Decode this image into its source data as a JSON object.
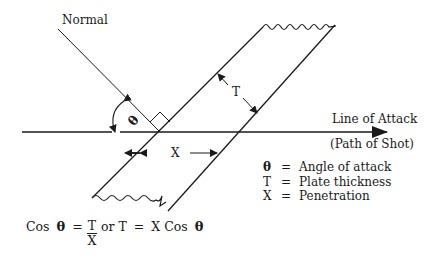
{
  "labels": {
    "normal": "Normal",
    "line_of_attack": "Line of Attack",
    "path_of_shot": "(Path of Shot)",
    "thickness_symbol": "T",
    "penetration_symbol": "X",
    "angle_symbol": "θ"
  },
  "legend": [
    {
      "symbol": "θ",
      "equals": "=",
      "meaning": "Angle of attack"
    },
    {
      "symbol": "T",
      "equals": "=",
      "meaning": "Plate thickness"
    },
    {
      "symbol": "X",
      "equals": "=",
      "meaning": "Penetration"
    }
  ],
  "formula": {
    "cos": "Cos",
    "theta": "θ",
    "eq1": "=",
    "numerator": "T",
    "denominator": "X",
    "or": "or T",
    "eq2": "=",
    "rhs": "X Cos",
    "theta2": "θ"
  },
  "colors": {
    "line": "#1a1a1a",
    "background": "#ffffff"
  }
}
